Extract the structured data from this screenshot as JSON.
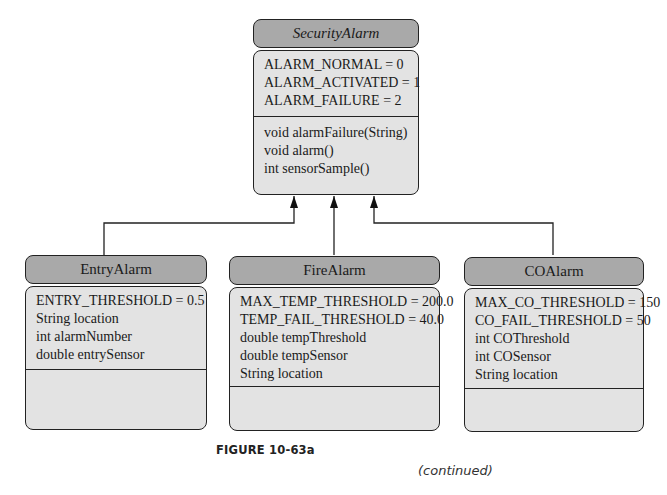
{
  "classes": {
    "security_alarm": {
      "name": "SecurityAlarm",
      "attributes": [
        "ALARM_NORMAL = 0",
        "ALARM_ACTIVATED = 1",
        "ALARM_FAILURE = 2"
      ],
      "methods": [
        "void alarmFailure(String)",
        "void alarm()",
        "int sensorSample()"
      ]
    },
    "entry_alarm": {
      "name": "EntryAlarm",
      "attributes": [
        "ENTRY_THRESHOLD = 0.5",
        "String location",
        "int alarmNumber",
        "double entrySensor"
      ],
      "methods": []
    },
    "fire_alarm": {
      "name": "FireAlarm",
      "attributes": [
        "MAX_TEMP_THRESHOLD = 200.0",
        "TEMP_FAIL_THRESHOLD = 40.0",
        "double tempThreshold",
        "double tempSensor",
        "String location"
      ],
      "methods": []
    },
    "co_alarm": {
      "name": "COAlarm",
      "attributes": [
        "MAX_CO_THRESHOLD = 150",
        "CO_FAIL_THRESHOLD = 50",
        "int COThreshold",
        "int COSensor",
        "String location"
      ],
      "methods": []
    }
  },
  "relationships": [
    {
      "type": "inheritance",
      "from": "EntryAlarm",
      "to": "SecurityAlarm"
    },
    {
      "type": "inheritance",
      "from": "FireAlarm",
      "to": "SecurityAlarm"
    },
    {
      "type": "inheritance",
      "from": "COAlarm",
      "to": "SecurityAlarm"
    }
  ],
  "caption": "FIGURE 10-63a",
  "continued": "(continued)"
}
